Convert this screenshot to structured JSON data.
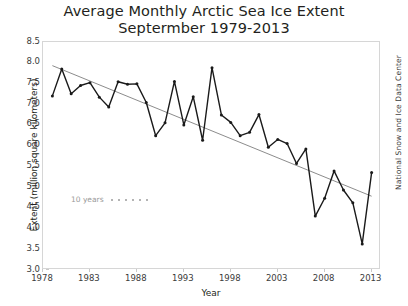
{
  "title": {
    "line1": "Average Monthly Arctic Sea Ice Extent",
    "line2": "Septermber 1979-2013"
  },
  "credit": "National Snow and Ice Data Center",
  "annotation": {
    "label": "10 years",
    "dot_count": 6
  },
  "colors": {
    "series_line": "#1a1a1a",
    "trend_line": "#8c8c8c",
    "frame": "#d6d6d6",
    "tick_text": "#3b3b3b",
    "annotation_text": "#9a9a9a",
    "background": "#ffffff"
  },
  "chart_data": {
    "type": "line",
    "title": "Average Monthly Arctic Sea Ice Extent Septermber 1979-2013",
    "xlabel": "Year",
    "ylabel": "Extent (million square kilometers)",
    "xlim": [
      1978,
      2014
    ],
    "ylim": [
      3.0,
      8.5
    ],
    "xticks": [
      1978,
      1983,
      1988,
      1993,
      1998,
      2003,
      2008,
      2013
    ],
    "yticks": [
      3.0,
      3.5,
      4.0,
      4.5,
      5.0,
      5.5,
      6.0,
      6.5,
      7.0,
      7.5,
      8.0,
      8.5
    ],
    "grid": false,
    "legend": "none",
    "markers": true,
    "x": [
      1979,
      1980,
      1981,
      1982,
      1983,
      1984,
      1985,
      1986,
      1987,
      1988,
      1989,
      1990,
      1991,
      1992,
      1993,
      1994,
      1995,
      1996,
      1997,
      1998,
      1999,
      2000,
      2001,
      2002,
      2003,
      2004,
      2005,
      2006,
      2007,
      2008,
      2009,
      2010,
      2011,
      2012,
      2013
    ],
    "series": [
      {
        "name": "September Arctic sea ice extent",
        "values": [
          7.2,
          7.85,
          7.25,
          7.45,
          7.52,
          7.17,
          6.93,
          7.54,
          7.48,
          7.49,
          7.04,
          6.24,
          6.55,
          7.55,
          6.5,
          7.18,
          6.13,
          7.88,
          6.74,
          6.56,
          6.24,
          6.32,
          6.75,
          5.96,
          6.15,
          6.05,
          5.57,
          5.92,
          4.3,
          4.73,
          5.39,
          4.93,
          4.62,
          3.63,
          5.35
        ]
      }
    ],
    "trend": {
      "name": "Linear trend",
      "style": "solid",
      "color": "#8c8c8c",
      "x": [
        1979,
        2013
      ],
      "values": [
        7.93,
        4.78
      ]
    }
  }
}
